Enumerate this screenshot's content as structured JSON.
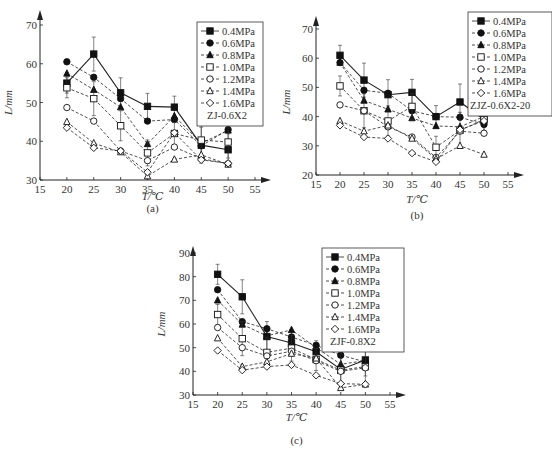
{
  "chart_data": [
    {
      "id": "a",
      "type": "line",
      "caption": "(a)",
      "xlabel": "T/℃",
      "ylabel": "L/mm",
      "xlim": [
        15,
        55
      ],
      "ylim": [
        30,
        70
      ],
      "xticks": [
        15,
        20,
        25,
        30,
        35,
        40,
        45,
        50,
        55
      ],
      "yticks": [
        30,
        40,
        50,
        60,
        70
      ],
      "grid": false,
      "legend_position": "upper right",
      "legend_note": "ZJ-0.6X2",
      "x": [
        20,
        25,
        30,
        35,
        40,
        45,
        50
      ],
      "series": [
        {
          "name": "0.4MPa",
          "marker": "square-filled",
          "line": "solid",
          "values": [
            55,
            62.5,
            52.5,
            49,
            48.8,
            39,
            37.8
          ]
        },
        {
          "name": "0.6MPa",
          "marker": "circle-filled",
          "line": "dashed",
          "values": [
            60.5,
            56.5,
            51,
            45.2,
            45.6,
            38.8,
            43
          ]
        },
        {
          "name": "0.8MPa",
          "marker": "triangle-filled",
          "line": "dashed",
          "values": [
            57.5,
            53.3,
            48.8,
            39.3,
            46.5,
            39.5,
            42.8
          ]
        },
        {
          "name": "1.0MPa",
          "marker": "square-open",
          "line": "dashed",
          "values": [
            53.8,
            51,
            44,
            37,
            42,
            40.3,
            39.8
          ]
        },
        {
          "name": "1.2MPa",
          "marker": "circle-open",
          "line": "dashed",
          "values": [
            48.7,
            45.2,
            37.5,
            35,
            38.5,
            35.5,
            34.2
          ]
        },
        {
          "name": "1.4MPa",
          "marker": "triangle-open",
          "line": "dashed",
          "values": [
            45,
            39.5,
            37.2,
            31,
            35.3,
            36.5,
            34
          ]
        },
        {
          "name": "1.6MPa",
          "marker": "diamond-open",
          "line": "dashed",
          "values": [
            43.5,
            38.3,
            37.5,
            32,
            42.2,
            35.2,
            34.3
          ]
        }
      ]
    },
    {
      "id": "b",
      "type": "line",
      "caption": "(b)",
      "xlabel": "T/℃",
      "ylabel": "L/mm",
      "xlim": [
        15,
        55
      ],
      "ylim": [
        20,
        70
      ],
      "xticks": [
        15,
        20,
        25,
        30,
        35,
        40,
        45,
        50,
        55
      ],
      "yticks": [
        20,
        30,
        40,
        50,
        60,
        70
      ],
      "grid": false,
      "legend_position": "upper right",
      "legend_note": "ZJZ-0.6X2-20",
      "x": [
        20,
        25,
        30,
        35,
        40,
        45,
        50
      ],
      "series": [
        {
          "name": "0.4MPa",
          "marker": "square-filled",
          "line": "solid",
          "values": [
            61,
            52.5,
            47.5,
            48.3,
            40,
            45,
            39
          ]
        },
        {
          "name": "0.6MPa",
          "marker": "circle-filled",
          "line": "dashed",
          "values": [
            58.5,
            49,
            48,
            42,
            40,
            39.8,
            37.3
          ]
        },
        {
          "name": "0.8MPa",
          "marker": "triangle-filled",
          "line": "dashed",
          "values": [
            58.5,
            45.5,
            42.5,
            39.5,
            36.8,
            36.5,
            40
          ]
        },
        {
          "name": "1.0MPa",
          "marker": "square-open",
          "line": "dashed",
          "values": [
            50.5,
            42,
            38.5,
            43.5,
            29.5,
            35.3,
            39
          ]
        },
        {
          "name": "1.2MPa",
          "marker": "circle-open",
          "line": "dashed",
          "values": [
            44,
            42,
            36.5,
            33,
            26,
            35,
            34.3
          ]
        },
        {
          "name": "1.4MPa",
          "marker": "triangle-open",
          "line": "dashed",
          "values": [
            38.5,
            35,
            37,
            32.5,
            25.5,
            30,
            27
          ]
        },
        {
          "name": "1.6MPa",
          "marker": "diamond-open",
          "line": "dashed",
          "values": [
            37,
            33,
            32.5,
            27.5,
            24.5,
            35.5,
            38.5
          ]
        }
      ]
    },
    {
      "id": "c",
      "type": "line",
      "caption": "(c)",
      "xlabel": "T/℃",
      "ylabel": "L/mm",
      "xlim": [
        15,
        55
      ],
      "ylim": [
        30,
        90
      ],
      "xticks": [
        15,
        20,
        25,
        30,
        35,
        40,
        45,
        50,
        55
      ],
      "yticks": [
        30,
        40,
        50,
        60,
        70,
        80,
        90
      ],
      "grid": false,
      "legend_position": "upper right",
      "legend_note": "ZJF-0.8X2",
      "x": [
        20,
        25,
        30,
        35,
        40,
        45,
        50
      ],
      "series": [
        {
          "name": "0.4MPa",
          "marker": "square-filled",
          "line": "solid",
          "values": [
            81,
            71.5,
            54.7,
            52,
            48.3,
            40.8,
            44.8
          ]
        },
        {
          "name": "0.6MPa",
          "marker": "circle-filled",
          "line": "dashed",
          "values": [
            74.5,
            61,
            58,
            54.5,
            51,
            46.8,
            44
          ]
        },
        {
          "name": "0.8MPa",
          "marker": "triangle-filled",
          "line": "dashed",
          "values": [
            70,
            59.8,
            55,
            57.5,
            50,
            43,
            44.5
          ]
        },
        {
          "name": "1.0MPa",
          "marker": "square-open",
          "line": "dashed",
          "values": [
            64,
            53.8,
            48,
            49.8,
            45,
            40.5,
            42
          ]
        },
        {
          "name": "1.2MPa",
          "marker": "circle-open",
          "line": "dashed",
          "values": [
            58.5,
            50,
            46.5,
            48.5,
            44.5,
            40,
            41.5
          ]
        },
        {
          "name": "1.4MPa",
          "marker": "triangle-open",
          "line": "dashed",
          "values": [
            54,
            42,
            44,
            47.5,
            45.5,
            33,
            34.5
          ]
        },
        {
          "name": "1.6MPa",
          "marker": "diamond-open",
          "line": "dashed",
          "values": [
            48.8,
            40.5,
            42,
            42.7,
            38.3,
            34.8,
            34.5
          ]
        }
      ]
    }
  ]
}
